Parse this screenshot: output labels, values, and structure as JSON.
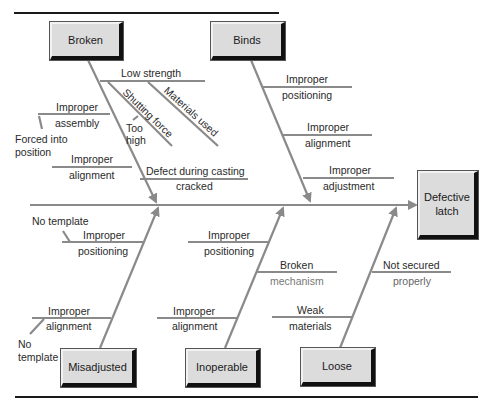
{
  "diagram": {
    "type": "fishbone",
    "effect": "Defective latch",
    "colors": {
      "bone": "#8a8a8a",
      "frame": "#1a1a1a",
      "box_fill": "#dcdcdc",
      "box_shadow": "#111111",
      "text": "#2a2a2a"
    },
    "categories": {
      "broken": {
        "label": "Broken",
        "causes": {
          "low_strength": "Low strength",
          "materials_used": "Materials used",
          "shutting_force": "Shutting force",
          "too_high": "Too high",
          "improper_assembly_1": "Improper",
          "improper_assembly_2": "assembly",
          "forced_into_position_1": "Forced into",
          "forced_into_position_2": "position",
          "improper_alignment_1": "Improper",
          "improper_alignment_2": "alignment",
          "defect_casting": "Defect during casting",
          "cracked": "cracked"
        }
      },
      "binds": {
        "label": "Binds",
        "causes": {
          "pos_1": "Improper",
          "pos_2": "positioning",
          "align_1": "Improper",
          "align_2": "alignment",
          "adjust_1": "Improper",
          "adjust_2": "adjustment"
        }
      },
      "misadjusted": {
        "label": "Misadjusted",
        "causes": {
          "no_template_a": "No template",
          "pos_1": "Improper",
          "pos_2": "positioning",
          "align_1": "Improper",
          "align_2": "alignment",
          "no_template_b_1": "No",
          "no_template_b_2": "template"
        }
      },
      "inoperable": {
        "label": "Inoperable",
        "causes": {
          "pos_1": "Improper",
          "pos_2": "positioning",
          "broken_mech_1": "Broken",
          "broken_mech_2": "mechanism",
          "align_1": "Improper",
          "align_2": "alignment"
        }
      },
      "loose": {
        "label": "Loose",
        "causes": {
          "not_secured_1": "Not secured",
          "not_secured_2": "properly",
          "weak_1": "Weak",
          "weak_2": "materials"
        }
      }
    },
    "effect_lines": {
      "line1": "Defective",
      "line2": "latch"
    }
  }
}
